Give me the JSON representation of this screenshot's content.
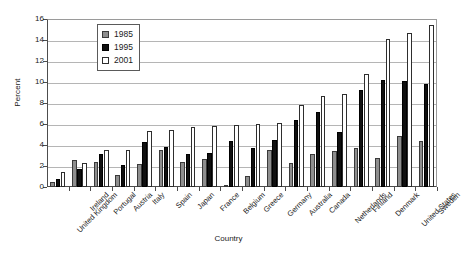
{
  "chart_data": {
    "type": "bar",
    "title": "",
    "xlabel": "Country",
    "ylabel": "Percent",
    "ylim": [
      0,
      16
    ],
    "ytick_values": [
      0,
      2,
      4,
      6,
      8,
      10,
      12,
      14,
      16
    ],
    "ytick_labels": [
      "0",
      "2",
      "4",
      "6",
      "8",
      "10",
      "12",
      "14",
      "16"
    ],
    "grid": true,
    "legend_position": "upper left",
    "categories": [
      "United Kingdom",
      "Ireland",
      "Portugal",
      "Austria",
      "Italy",
      "Spain",
      "Japan",
      "France",
      "Belgium",
      "Greece",
      "Germany",
      "Australia",
      "Canada",
      "Netherlands",
      "Finland",
      "Denmark",
      "United States",
      "Sweden"
    ],
    "series": [
      {
        "name": "1985",
        "color": "#8e8e8e",
        "values": [
          0.45,
          2.6,
          2.35,
          1.15,
          2.2,
          3.55,
          2.4,
          2.7,
          0.15,
          1.05,
          3.5,
          2.25,
          3.1,
          3.4,
          3.7,
          2.75,
          4.9,
          4.4
        ]
      },
      {
        "name": "1995",
        "color": "#101010",
        "values": [
          0.8,
          1.75,
          3.1,
          2.05,
          4.3,
          3.8,
          3.1,
          3.2,
          4.4,
          3.7,
          4.45,
          6.35,
          7.15,
          5.2,
          9.25,
          10.15,
          10.05,
          9.8
        ]
      },
      {
        "name": "2001",
        "color": "#ffffff",
        "values": [
          1.45,
          2.25,
          3.5,
          3.5,
          5.3,
          5.45,
          5.75,
          5.8,
          5.95,
          6.0,
          6.05,
          7.8,
          8.65,
          8.9,
          10.8,
          14.1,
          14.65,
          15.45
        ]
      }
    ]
  },
  "legend": {
    "items": [
      {
        "label": "1985",
        "swatch": "gray-square-icon"
      },
      {
        "label": "1995",
        "swatch": "black-square-icon"
      },
      {
        "label": "2001",
        "swatch": "white-square-icon"
      }
    ]
  }
}
